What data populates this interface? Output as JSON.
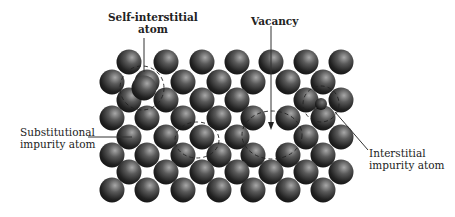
{
  "labels": {
    "self_interstitial": {
      "line1": "Self-interstitial",
      "line2": "atom"
    },
    "vacancy": {
      "line1": "Vacancy"
    },
    "substitutional": {
      "line1": "Substitutional",
      "line2": "impurity atom"
    },
    "interstitial_impurity": {
      "line1": "Interstitial",
      "line2": "impurity atom"
    }
  },
  "colors": {
    "atom_dark": "#1a1a1a",
    "atom_mid": "#555555",
    "atom_highlight": "#b0b0b0",
    "leader_line": "#333333",
    "dashed_outline": "#222222"
  }
}
